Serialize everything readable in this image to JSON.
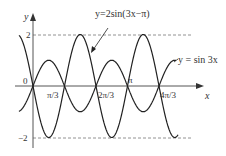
{
  "diagram": {
    "axes": {
      "x_label": "x",
      "y_label": "y",
      "origin_label": "0"
    },
    "x_ticks": [
      "π/3",
      "2π/3",
      "π",
      "4π/3"
    ],
    "y_ticks": [
      "2",
      "-2"
    ],
    "curve_labels": {
      "big": "y=2sin(3x−π)",
      "small": "y = sin 3x"
    }
  },
  "chart_data": {
    "type": "line",
    "title": "",
    "xlabel": "x",
    "ylabel": "y",
    "x_ticks": [
      "0",
      "π/3",
      "2π/3",
      "π",
      "4π/3"
    ],
    "y_ticks": [
      2,
      -2
    ],
    "xlim": [
      "-π/6",
      "4π/3"
    ],
    "ylim": [
      -2,
      2
    ],
    "grid": false,
    "series": [
      {
        "name": "y = sin 3x",
        "expression": "sin(3x)",
        "amplitude": 1,
        "period": "2π/3"
      },
      {
        "name": "y=2sin(3x−π)",
        "expression": "2sin(3x-π)",
        "amplitude": 2,
        "period": "2π/3"
      }
    ],
    "reference_lines": [
      {
        "y": 2,
        "style": "dashed"
      },
      {
        "y": -2,
        "style": "dashed"
      }
    ]
  }
}
